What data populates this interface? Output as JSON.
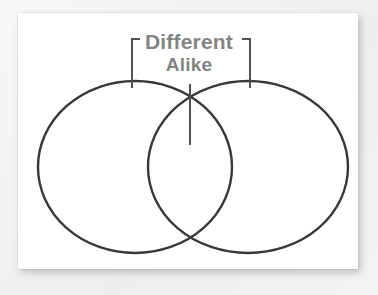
{
  "diagram": {
    "type": "venn-two-circle",
    "title_visible": false,
    "labels": {
      "different": "Different",
      "alike": "Alike"
    },
    "colors": {
      "label_text": "#848484",
      "circle_stroke": "#383838",
      "leader_stroke": "#4a4a4a",
      "card_background": "#ffffff",
      "page_background": "#f2f2f2"
    },
    "geometry": {
      "left_circle": {
        "cx": 135,
        "cy": 167,
        "rx": 97,
        "ry": 86
      },
      "right_circle": {
        "cx": 248,
        "cy": 167,
        "rx": 100,
        "ry": 86
      },
      "intersection_top": {
        "x": 190,
        "y": 95
      },
      "intersection_bottom": {
        "x": 190,
        "y": 237
      },
      "bracket_left_x": 132,
      "bracket_right_x": 250,
      "bracket_top_y": 38,
      "bracket_bottom_y": 88,
      "alike_pointer_top_y": 84,
      "alike_pointer_bottom_y": 145
    },
    "regions": [
      {
        "name": "left-only",
        "meaning": "Different"
      },
      {
        "name": "overlap",
        "meaning": "Alike"
      },
      {
        "name": "right-only",
        "meaning": "Different"
      }
    ]
  }
}
